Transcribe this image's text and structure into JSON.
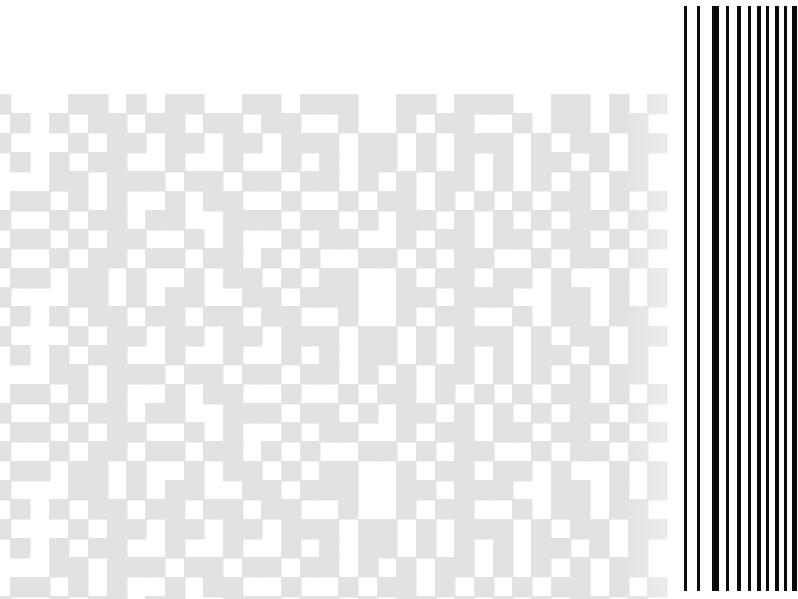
{
  "page": {
    "width": 798,
    "height": 599,
    "background_color": "#ffffff"
  },
  "watermark": {
    "name": "pixel-block-watermark",
    "fill_color": "#e2e2e2",
    "cell_size": 19.3,
    "origin_x": -9,
    "origin_y": 94,
    "columns": 35,
    "rows": 27,
    "tile_rows": 10,
    "comment": "1 = filled grey cell, 0 = white. Tile repeats vertically every 10 rows.",
    "tile": [
      "10001101011001101110011011100110101",
      "01010110110110110010010110010110110",
      "10001011011011011101101011101011011",
      "01010110010010010101101010101101010",
      "00011011101101101101010110101010110",
      "01101010010110010010110101010110101",
      "10010110110011101101011010101011010",
      "01101011001010010110010110110110101",
      "10010110110110101001101011001011010",
      "01101101001011010110010110110100101"
    ]
  },
  "barcode": {
    "name": "vertical-barcode",
    "bar_color": "#0a0a0a",
    "top": 6,
    "bottom": 591,
    "height": 585,
    "bar_count": 11,
    "bars": [
      {
        "x": 684,
        "width": 3
      },
      {
        "x": 697,
        "width": 3
      },
      {
        "x": 712,
        "width": 7
      },
      {
        "x": 726,
        "width": 3
      },
      {
        "x": 737,
        "width": 4
      },
      {
        "x": 748,
        "width": 3
      },
      {
        "x": 757,
        "width": 4
      },
      {
        "x": 766,
        "width": 3
      },
      {
        "x": 775,
        "width": 4
      },
      {
        "x": 784,
        "width": 3
      },
      {
        "x": 792,
        "width": 5
      }
    ]
  }
}
